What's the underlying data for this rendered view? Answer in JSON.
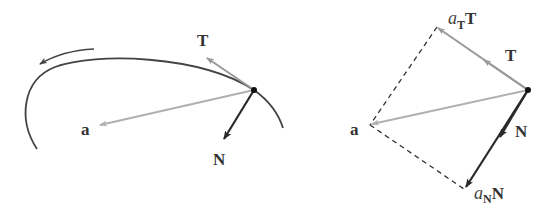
{
  "colors": {
    "curve": "#444444",
    "tangent": "#9a9a9a",
    "acceleration": "#b0b0b0",
    "normal": "#2a2a2a",
    "dashed": "#333333",
    "point": "#111111",
    "background": "#ffffff"
  },
  "left_diagram": {
    "labels": {
      "tangent": "T",
      "acceleration": "a",
      "normal": "N"
    },
    "direction_arrow": "counterclockwise-motion-arrow"
  },
  "right_diagram": {
    "labels": {
      "tangent_component_coef": "a",
      "tangent_component_sub": "T",
      "tangent_component_vec": "T",
      "tangent": "T",
      "acceleration": "a",
      "normal": "N",
      "normal_component_coef": "a",
      "normal_component_sub": "N",
      "normal_component_vec": "N"
    }
  }
}
